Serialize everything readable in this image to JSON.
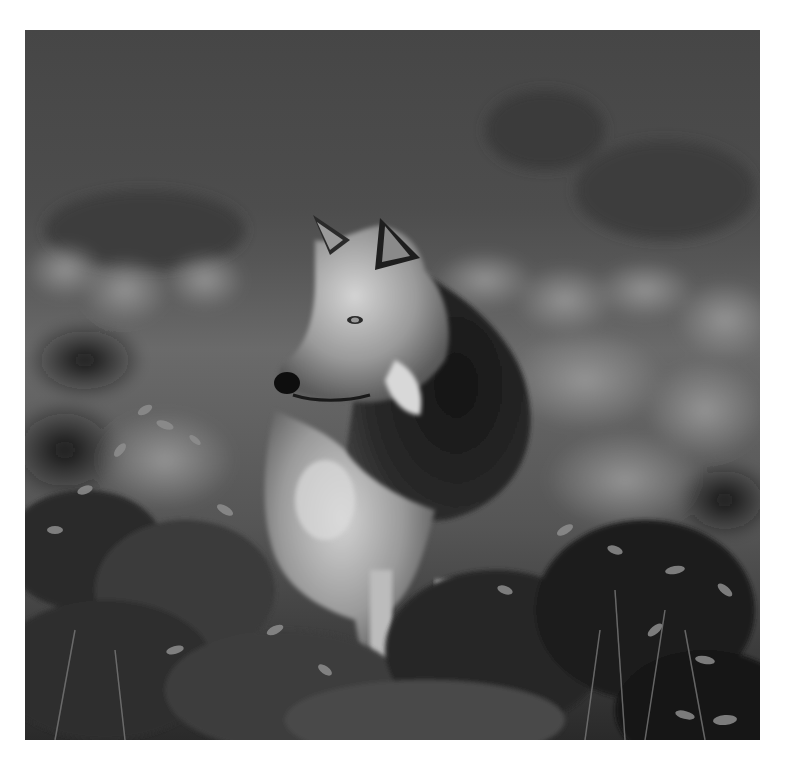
{
  "photo": {
    "subject": "gray wolf standing in low shrubs, looking left",
    "style": "black-and-white photograph",
    "colors": {
      "page_background": "#ffffff",
      "sky_dark": "#3a3a3a",
      "sky_mid": "#555555",
      "foliage_light": "#8a8a8a",
      "foliage_dark": "#1c1c1c",
      "fur_light": "#cfcfcf",
      "fur_mid": "#8c8c8c",
      "fur_dark": "#1a1a1a"
    },
    "frame": {
      "x": 25,
      "y": 30,
      "width": 735,
      "height": 710
    }
  }
}
